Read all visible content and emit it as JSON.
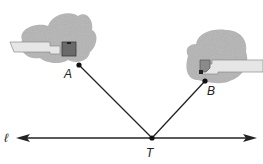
{
  "diagram": {
    "type": "geometry-reflection",
    "line": {
      "label": "ℓ",
      "y": 138,
      "x_start": 18,
      "x_end": 255
    },
    "points": [
      {
        "id": "A",
        "label": "A",
        "x": 79,
        "y": 65
      },
      {
        "id": "B",
        "label": "B",
        "x": 205,
        "y": 81
      },
      {
        "id": "T",
        "label": "T",
        "x": 152,
        "y": 138
      }
    ],
    "segments": [
      {
        "from": "A",
        "to": "T"
      },
      {
        "from": "B",
        "to": "T"
      }
    ],
    "objects": [
      {
        "name": "left-building-blob",
        "near": "A"
      },
      {
        "name": "right-building-blob",
        "near": "B"
      }
    ],
    "colors": {
      "line": "#222222",
      "blob": "#b4b4b4",
      "pipe": "#dcdcdc",
      "box": "#6a6a6a"
    }
  }
}
